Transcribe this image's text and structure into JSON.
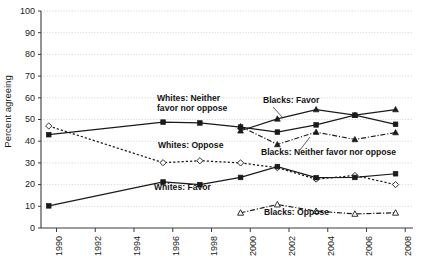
{
  "chart_data": {
    "type": "line",
    "title": "",
    "subtitle": "",
    "xlabel": "",
    "ylabel": "Percent agreeing",
    "xlim": [
      1989.2,
      2008.4
    ],
    "ylim": [
      0,
      100
    ],
    "ytick_step": 10,
    "grid": true,
    "legend_position": "inline-annotations",
    "x_ticks": [
      "1990",
      "1992",
      "1994",
      "1996",
      "1998",
      "2000",
      "2002",
      "2004",
      "2006",
      "2008"
    ],
    "x_tick_values": [
      1990,
      1992,
      1994,
      1996,
      1998,
      2000,
      2002,
      2004,
      2006,
      2008
    ],
    "y_ticks": [
      "0",
      "10",
      "20",
      "30",
      "40",
      "50",
      "60",
      "70",
      "80",
      "90",
      "100"
    ],
    "y_tick_values": [
      0,
      10,
      20,
      30,
      40,
      50,
      60,
      70,
      80,
      90,
      100
    ],
    "series": [
      {
        "name": "Whites: Neither favor nor oppose",
        "label": "Whites: Neither\nfavor nor oppose",
        "line_style": "solid",
        "marker": "filled-square",
        "color": "#1a1a1a",
        "x": [
          1989.6,
          1995.5,
          1997.4,
          1999.5,
          2001.4,
          2003.4,
          2005.4,
          2007.5
        ],
        "values": [
          43,
          48.8,
          48.4,
          46.5,
          44.2,
          47.5,
          52.0,
          47.8
        ]
      },
      {
        "name": "Whites: Oppose",
        "label": "Whites: Oppose",
        "line_style": "dotted",
        "marker": "open-diamond",
        "color": "#1a1a1a",
        "x": [
          1989.6,
          1995.5,
          1997.4,
          1999.5,
          2001.4,
          2003.4,
          2005.4,
          2007.5
        ],
        "values": [
          47,
          30.1,
          31.0,
          30.0,
          27.8,
          22.5,
          24.2,
          20.0
        ]
      },
      {
        "name": "Whites: Favor",
        "label": "Whites: Favor",
        "line_style": "solid",
        "marker": "filled-square",
        "color": "#1a1a1a",
        "x": [
          1989.6,
          1995.5,
          1997.4,
          1999.5,
          2001.4,
          2003.4,
          2005.4,
          2007.5
        ],
        "values": [
          10.2,
          21.2,
          20.0,
          23.3,
          28.3,
          23.2,
          23.3,
          25.0
        ]
      },
      {
        "name": "Blacks: Favor",
        "label": "Blacks: Favor",
        "line_style": "solid",
        "marker": "filled-triangle",
        "color": "#1a1a1a",
        "x": [
          1999.5,
          2001.4,
          2003.4,
          2005.4,
          2007.5
        ],
        "values": [
          44.8,
          50.3,
          54.6,
          52.0,
          54.6
        ]
      },
      {
        "name": "Blacks: Neither favor nor oppose",
        "label": "Blacks: Neither favor nor oppose",
        "line_style": "dash-dot",
        "marker": "filled-triangle",
        "color": "#1a1a1a",
        "x": [
          1999.5,
          2001.4,
          2003.4,
          2005.4,
          2007.5
        ],
        "values": [
          46.8,
          38.5,
          44.2,
          40.8,
          44.0
        ]
      },
      {
        "name": "Blacks: Oppose",
        "label": "Blacks: Oppose",
        "line_style": "dash-dot",
        "marker": "open-triangle",
        "color": "#1a1a1a",
        "x": [
          1999.5,
          2001.4,
          2003.4,
          2005.4,
          2007.5
        ],
        "values": [
          7.0,
          10.8,
          7.8,
          6.5,
          7.0
        ]
      }
    ],
    "annotations": [
      {
        "id": "whites-neither",
        "lines": [
          "Whites: Neither",
          "favor nor oppose"
        ],
        "x": 157,
        "y": 101,
        "anchor": "start",
        "leader": null
      },
      {
        "id": "blacks-favor",
        "lines": [
          "Blacks: Favor"
        ],
        "x": 263,
        "y": 103,
        "anchor": "start",
        "leader": {
          "x1": 273,
          "y1": 107,
          "x2": 283,
          "y2": 118
        }
      },
      {
        "id": "whites-oppose",
        "lines": [
          "Whites: Oppose"
        ],
        "x": 158,
        "y": 148,
        "anchor": "start",
        "leader": null
      },
      {
        "id": "blacks-neither",
        "lines": [
          "Blacks: Neither favor nor oppose"
        ],
        "x": 261,
        "y": 155,
        "anchor": "start",
        "leader": {
          "x1": 300,
          "y1": 150,
          "x2": 310,
          "y2": 137
        }
      },
      {
        "id": "whites-favor",
        "lines": [
          "Whites: Favor"
        ],
        "x": 154,
        "y": 190,
        "anchor": "start",
        "leader": null
      },
      {
        "id": "blacks-oppose",
        "lines": [
          "Blacks: Oppose"
        ],
        "x": 264,
        "y": 215,
        "anchor": "start",
        "leader": null
      }
    ]
  }
}
